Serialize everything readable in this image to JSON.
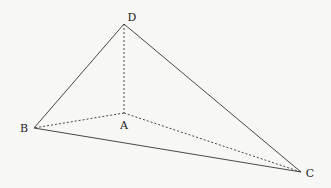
{
  "diagram": {
    "type": "tetrahedron",
    "points": {
      "A": {
        "label": "A",
        "x": 124,
        "y": 113,
        "lx": 124,
        "ly": 129
      },
      "B": {
        "label": "B",
        "x": 34,
        "y": 128,
        "lx": 24,
        "ly": 132
      },
      "C": {
        "label": "C",
        "x": 301,
        "y": 172,
        "lx": 310,
        "ly": 177
      },
      "D": {
        "label": "D",
        "x": 124,
        "y": 24,
        "lx": 132,
        "ly": 21
      }
    },
    "solid_edges": [
      [
        "D",
        "B"
      ],
      [
        "D",
        "C"
      ],
      [
        "B",
        "C"
      ]
    ],
    "dashed_edges": [
      [
        "D",
        "A"
      ],
      [
        "A",
        "B"
      ],
      [
        "A",
        "C"
      ]
    ],
    "line_color": "#333333"
  }
}
